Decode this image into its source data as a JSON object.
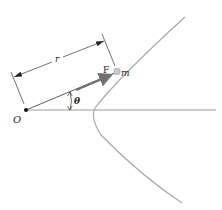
{
  "diagram": {
    "labels": {
      "origin": "O",
      "radius": "r",
      "force": "F",
      "mass": "m",
      "angle": "θ"
    },
    "colors": {
      "background": "#ffffff",
      "lines": "#333333",
      "trajectory": "#a8a8a8",
      "axis": "#9a9a9a",
      "force_arrow": "#707070",
      "mass_particle": "#c8c8c8"
    }
  }
}
